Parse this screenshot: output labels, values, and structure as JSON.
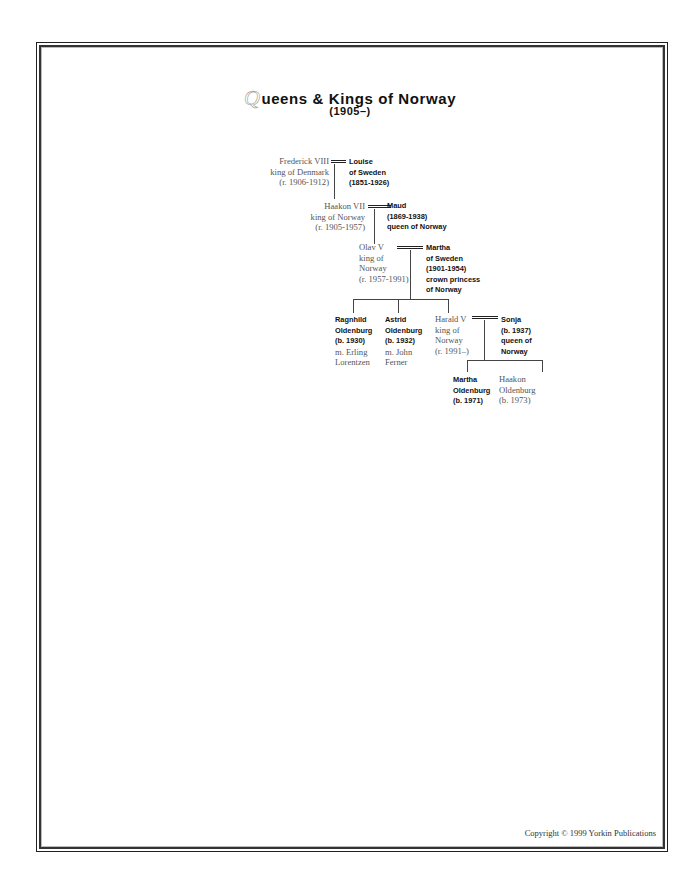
{
  "document": {
    "title_initial": "Q",
    "title_rest": "ueens & Kings of Norway",
    "subtitle": "(1905–)",
    "copyright": "Copyright © 1999 Yorkin Publications"
  },
  "tree": {
    "gen1": {
      "frederick": [
        "Frederick VIII",
        "king of Denmark",
        "(r. 1906-1912)"
      ],
      "louise": [
        "Louise",
        "of Sweden",
        "(1851-1926)"
      ]
    },
    "gen2": {
      "haakon": [
        "Haakon VII",
        "king of Norway",
        "(r. 1905-1957)"
      ],
      "maud": [
        "Maud",
        "(1869-1938)",
        "queen of Norway"
      ]
    },
    "gen3": {
      "olav": [
        "Olav V",
        "king of",
        "Norway",
        "(r. 1957-1991)"
      ],
      "martha": [
        "Martha",
        "of Sweden",
        "(1901-1954)",
        "crown princess",
        "of Norway"
      ]
    },
    "gen4": {
      "ragnhild": [
        "Ragnhild",
        "Oldenburg",
        "(b. 1930)",
        "m. Erling",
        "Lorentzen"
      ],
      "astrid": [
        "Astrid",
        "Oldenburg",
        "(b. 1932)",
        "m. John",
        "Ferner"
      ],
      "harald": [
        "Harald V",
        "king of",
        "Norway",
        "(r. 1991–)"
      ],
      "sonja": [
        "Sonja",
        "(b. 1937)",
        "queen of",
        "Norway"
      ]
    },
    "gen5": {
      "martha_b": [
        "Martha",
        "Oldenburg",
        "(b. 1971)"
      ],
      "haakon_b": [
        "Haakon",
        "Oldenburg",
        "(b. 1973)"
      ]
    }
  }
}
